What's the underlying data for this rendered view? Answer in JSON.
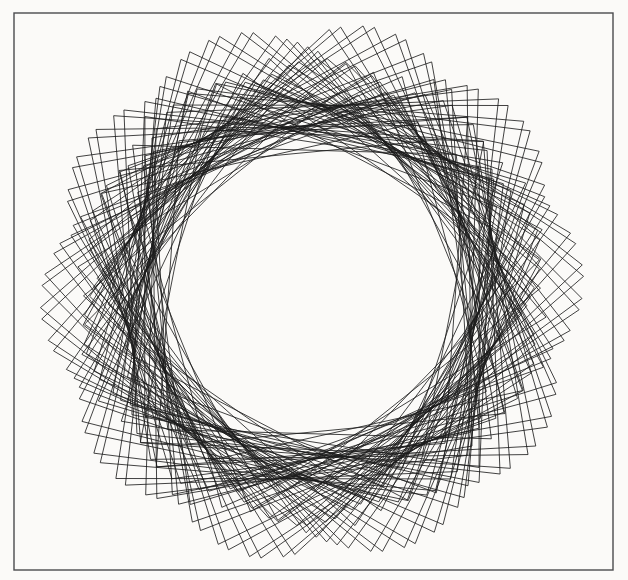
{
  "canvas": {
    "width": 628,
    "height": 580,
    "background_color": "#fbfaf8",
    "paper_tint": "#f8f7f4"
  },
  "frame": {
    "name": "page-border",
    "x": 14,
    "y": 13,
    "width": 599,
    "height": 557,
    "stroke_color": "#4a4a4e",
    "stroke_width": 1.4
  },
  "figure": {
    "stroke_color": "#1c1c1c",
    "stroke_width": 0.9,
    "stroke_opacity": 0.92
  },
  "chart_data": {
    "type": "line",
    "subtitle": "Turtle-graphics rosette: 76 squares, each rotated 73.42° and scaled about the centre",
    "xlabel": "",
    "ylabel": "",
    "grid": false,
    "legend": null,
    "xlim": [
      0,
      628
    ],
    "ylim": [
      0,
      580
    ],
    "geometry": {
      "center_x": 312,
      "center_y": 292,
      "polygon_sides": 4,
      "polygon_count": 76,
      "rotation_step_deg": 73.42,
      "cusp_count": 5,
      "outer_radius_max": 272,
      "outer_radius_min": 228,
      "inner_envelope_radius": 140,
      "radius_modulation_amplitude": 22,
      "radius_modulation_lobes": 5,
      "base_orientation_deg": -14,
      "side_ratio": 0.86,
      "skew_deg": 3.5
    },
    "bounds_observed": {
      "left": 34,
      "right": 588,
      "top": 28,
      "bottom": 528
    },
    "series": [
      {
        "name": "rotating-quadrilaterals",
        "values": [
          272,
          268,
          263,
          257,
          250,
          243,
          237,
          232,
          229,
          228,
          229,
          232,
          237,
          243,
          250,
          257,
          263,
          268,
          271,
          272
        ]
      }
    ]
  }
}
